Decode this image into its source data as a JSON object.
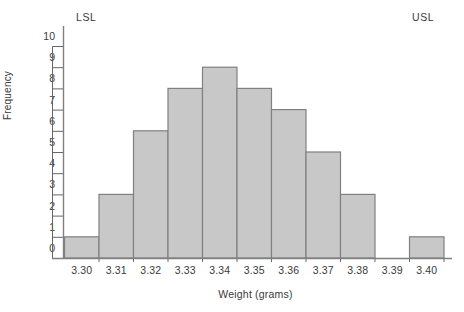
{
  "chart_data": {
    "type": "bar",
    "title": "",
    "xlabel": "Weight (grams)",
    "ylabel": "Frequency",
    "categories": [
      "3.30",
      "3.31",
      "3.32",
      "3.33",
      "3.34",
      "3.35",
      "3.36",
      "3.37",
      "3.38",
      "3.39",
      "3.40"
    ],
    "values": [
      1,
      3,
      6,
      8,
      9,
      8,
      7,
      5,
      3,
      0,
      1
    ],
    "ylim": [
      0,
      10
    ],
    "ytick_labels": [
      "0",
      "1",
      "2",
      "3",
      "4",
      "5",
      "6",
      "7",
      "8",
      "9",
      "10"
    ],
    "grid": false,
    "legend": null,
    "annotations": [
      {
        "text": "LSL",
        "position": "top-left"
      },
      {
        "text": "USL",
        "position": "top-right"
      }
    ],
    "colors": {
      "bar_fill": "#c8c8c8",
      "bar_stroke": "#808080",
      "axis": "#666666",
      "text": "#3a3a3a"
    }
  }
}
